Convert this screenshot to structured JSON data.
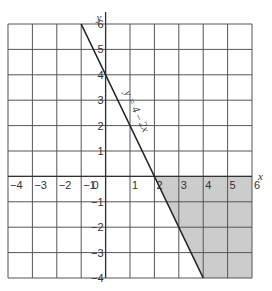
{
  "chart_data": {
    "type": "line",
    "title": "",
    "xlabel": "x",
    "ylabel": "y",
    "xlim": [
      -4,
      6
    ],
    "ylim": [
      -4,
      6
    ],
    "grid": true,
    "x_ticks": [
      "-4",
      "-3",
      "-2",
      "-1",
      "0",
      "1",
      "2",
      "3",
      "4",
      "5",
      "6"
    ],
    "y_ticks": [
      "6",
      "5",
      "4",
      "3",
      "2",
      "1",
      "-1",
      "-2",
      "-3",
      "-4"
    ],
    "series": [
      {
        "name": "y = 4 - 2x",
        "label": "y = 4 – 2x",
        "x": [
          -1,
          4
        ],
        "y": [
          6,
          -4
        ]
      }
    ],
    "shaded_region": {
      "description": "region below x-axis and right of y = 4 - 2x",
      "vertices": [
        [
          2,
          0
        ],
        [
          6,
          0
        ],
        [
          6,
          -4
        ],
        [
          4,
          -4
        ]
      ],
      "color": "#cccccc"
    },
    "colors": {
      "grid": "#555555",
      "line": "#222222",
      "shade": "#cccccc"
    }
  }
}
